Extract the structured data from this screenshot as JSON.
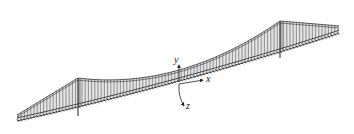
{
  "figure": {
    "colors": {
      "line": "#333333",
      "hanger": "#555555",
      "fill": "#d9d9d9",
      "background": "#ffffff"
    }
  },
  "geometry": {
    "deck_left": [
      17,
      118
    ],
    "deck_mid": [
      179,
      78
    ],
    "deck_right": [
      340,
      30
    ],
    "left_tower_top": [
      78,
      78
    ],
    "left_tower_base": [
      78,
      116
    ],
    "right_tower_top": [
      280,
      21
    ],
    "right_tower_base": [
      280,
      58
    ],
    "cable_sag_mid": [
      179,
      64
    ]
  },
  "axes": {
    "origin": [
      179,
      82
    ],
    "labels": {
      "x": "x",
      "y": "y",
      "z": "z"
    }
  }
}
